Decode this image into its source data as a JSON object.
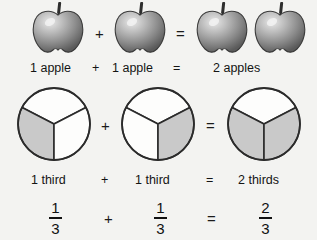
{
  "page": {
    "background_color": "#f3f3f1",
    "ink_color": "#1b1b1b",
    "shaded_sector_color": "#c9c9c9",
    "unshaded_sector_color": "#fdfdfc"
  },
  "rows": {
    "apple_row": {
      "name": "apple-illustration-row",
      "items": [
        {
          "icon": "apple-icon",
          "index": 1
        },
        {
          "icon": "apple-icon",
          "index": 2
        },
        {
          "icon": "apple-icon",
          "index": 3
        },
        {
          "icon": "apple-icon",
          "index": 4
        }
      ],
      "operators": {
        "plus": "+",
        "equals": "="
      }
    },
    "apple_words": {
      "name": "apple-word-equation",
      "left": "1 apple",
      "plus": "+",
      "right": "1 apple",
      "equals": "=",
      "result": "2 apples"
    },
    "pie_row": {
      "name": "pie-illustration-row",
      "operators": {
        "plus": "+",
        "equals": "="
      },
      "circles": [
        {
          "name": "pie-one-third-left",
          "total_sectors": 3,
          "shaded_sectors": 1,
          "shaded_positions": [
            "left"
          ]
        },
        {
          "name": "pie-one-third-right",
          "total_sectors": 3,
          "shaded_sectors": 1,
          "shaded_positions": [
            "right"
          ]
        },
        {
          "name": "pie-two-thirds",
          "total_sectors": 3,
          "shaded_sectors": 2,
          "shaded_positions": [
            "left",
            "right"
          ]
        }
      ]
    },
    "fraction_words": {
      "name": "fraction-word-equation",
      "left": "1 third",
      "plus": "+",
      "right": "1 third",
      "equals": "=",
      "result": "2 thirds"
    },
    "fraction_symbols": {
      "name": "fraction-symbol-equation",
      "left": {
        "numerator": "1",
        "denominator": "3"
      },
      "plus": "+",
      "right": {
        "numerator": "1",
        "denominator": "3"
      },
      "equals": "=",
      "result": {
        "numerator": "2",
        "denominator": "3"
      }
    }
  }
}
